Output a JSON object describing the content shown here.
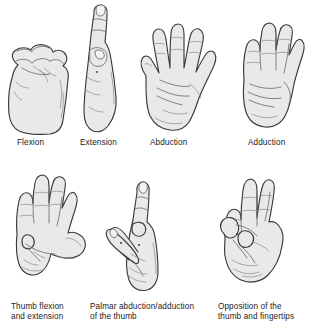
{
  "figure": {
    "background_color": "#ffffff",
    "line_color": "#3a3a3a",
    "fill_color": "#e9e9e7",
    "text_color": "#1b1b1b"
  },
  "rows": [
    {
      "row_index": 1,
      "panels": [
        {
          "id": "flexion",
          "caption": "Flexion",
          "icon": "closed-fist-hand",
          "description": "Closed fist, fingers curled into the palm"
        },
        {
          "id": "extension",
          "caption": "Extension",
          "icon": "extended-straight-hand",
          "description": "Hand seen edge on with fingers straightened"
        },
        {
          "id": "abduction",
          "caption": "Abduction",
          "icon": "open-palm-fingers-spread",
          "description": "Open palm with fingers spread apart"
        },
        {
          "id": "adduction",
          "caption": "Adduction",
          "icon": "open-palm-fingers-together",
          "description": "Open palm with fingers held together"
        }
      ]
    },
    {
      "row_index": 2,
      "panels": [
        {
          "id": "thumb-flexion-extension",
          "caption": "Thumb flexion\nand extension",
          "icon": "palm-thumb-across-palm",
          "description": "Palm with thumb flexed across the palm and extended outward"
        },
        {
          "id": "palmar-abduction-adduction",
          "caption": "Palmar abduction/adduction\nof the thumb",
          "icon": "side-hand-thumb-lifted",
          "description": "Side view of hand with thumb lifted away from the palm"
        },
        {
          "id": "opposition",
          "caption": "Opposition of the\nthumb and fingertips",
          "icon": "thumb-touching-fingertip",
          "description": "Thumb tip touching the index fingertip, other fingers extended"
        }
      ]
    }
  ]
}
